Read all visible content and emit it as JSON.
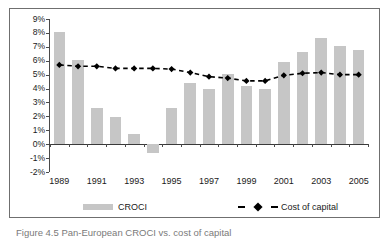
{
  "figure": {
    "caption": "Figure 4.5 Pan-European CROCI vs. cost of capital"
  },
  "legend": {
    "position": "bottom",
    "entries": [
      {
        "label": "CROCI",
        "marker": "bar-swatch",
        "color": "#c6c6c6"
      },
      {
        "label": "Cost of capital",
        "marker": "dashed-line-diamond",
        "color": "#000000"
      }
    ]
  },
  "axis": {
    "y_ticks": [
      "9%",
      "8%",
      "7%",
      "6%",
      "5%",
      "4%",
      "3%",
      "2%",
      "1%",
      "0%",
      "-1%",
      "-2%"
    ],
    "x_ticks": [
      "1989",
      "1991",
      "1993",
      "1995",
      "1997",
      "1999",
      "2001",
      "2003",
      "2005"
    ]
  },
  "chart_data": {
    "type": "bar",
    "title": "",
    "subtitle": "",
    "xlabel": "",
    "ylabel": "",
    "ylim": [
      -2,
      9
    ],
    "ytick_values": [
      9,
      8,
      7,
      6,
      5,
      4,
      3,
      2,
      1,
      0,
      -1,
      -2
    ],
    "ytick_labels": [
      "9%",
      "8%",
      "7%",
      "6%",
      "5%",
      "4%",
      "3%",
      "2%",
      "1%",
      "0%",
      "-1%",
      "-2%"
    ],
    "grid": false,
    "legend_position": "bottom",
    "categories": [
      "1989",
      "1990",
      "1991",
      "1992",
      "1993",
      "1994",
      "1995",
      "1996",
      "1997",
      "1998",
      "1999",
      "2000",
      "2001",
      "2002",
      "2003",
      "2004",
      "2005"
    ],
    "xtick_labels": [
      "1989",
      "1991",
      "1993",
      "1995",
      "1997",
      "1999",
      "2001",
      "2003",
      "2005"
    ],
    "series": [
      {
        "name": "CROCI",
        "type": "bar",
        "color": "#c6c6c6",
        "values": [
          8.1,
          6.05,
          2.6,
          1.95,
          0.7,
          -0.6,
          2.6,
          4.4,
          4.0,
          5.05,
          4.2,
          4.0,
          5.9,
          6.65,
          7.6,
          7.05,
          6.8
        ]
      },
      {
        "name": "Cost of capital",
        "type": "line",
        "color": "#000000",
        "linestyle": "dashed",
        "marker": "diamond",
        "values": [
          5.7,
          5.6,
          5.6,
          5.45,
          5.45,
          5.45,
          5.4,
          5.15,
          4.85,
          4.75,
          4.55,
          4.55,
          4.95,
          5.1,
          5.15,
          5.0,
          5.0
        ]
      }
    ]
  }
}
